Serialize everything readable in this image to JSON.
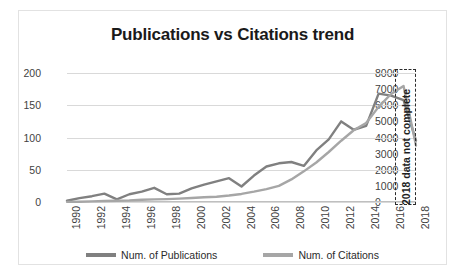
{
  "chart_data": {
    "type": "line",
    "title": "Publications vs Citations trend",
    "xlabel": "",
    "ylabel": "",
    "grid": true,
    "legend_position": "bottom",
    "x": [
      1990,
      1991,
      1992,
      1993,
      1994,
      1995,
      1996,
      1997,
      1998,
      1999,
      2000,
      2001,
      2002,
      2003,
      2004,
      2005,
      2006,
      2007,
      2008,
      2009,
      2010,
      2011,
      2012,
      2013,
      2014,
      2015,
      2016,
      2017,
      2018
    ],
    "xtick_labels": [
      "1990",
      "1992",
      "1994",
      "1996",
      "1998",
      "2000",
      "2002",
      "2004",
      "2006",
      "2008",
      "2010",
      "2012",
      "2014",
      "2016",
      "2018"
    ],
    "yticks_left": [
      0,
      50,
      100,
      150,
      200
    ],
    "ylim_left": [
      0,
      200
    ],
    "yticks_right": [
      0,
      1000,
      2000,
      3000,
      4000,
      5000,
      6000,
      7000,
      8000
    ],
    "ylim_right": [
      0,
      8000
    ],
    "series": [
      {
        "name": "Num. of Publications",
        "axis": "left",
        "color": "#808080",
        "values": [
          2,
          6,
          9,
          13,
          4,
          12,
          16,
          22,
          12,
          13,
          21,
          27,
          32,
          37,
          24,
          41,
          55,
          60,
          62,
          56,
          80,
          97,
          125,
          112,
          118,
          168,
          165,
          158,
          95
        ]
      },
      {
        "name": "Num. of Citations",
        "axis": "right",
        "color": "#a6a6a6",
        "values": [
          10,
          20,
          40,
          60,
          80,
          100,
          140,
          160,
          180,
          210,
          250,
          290,
          330,
          400,
          500,
          640,
          800,
          1000,
          1400,
          1900,
          2450,
          3100,
          3800,
          4450,
          4900,
          5900,
          6700,
          7200,
          3500
        ]
      }
    ],
    "annotation": {
      "text": "2018 data not complete",
      "orientation": "vertical",
      "style": "dashed-box"
    }
  },
  "legend": {
    "items": [
      {
        "label": "Num. of Publications",
        "color": "#808080"
      },
      {
        "label": "Num. of Citations",
        "color": "#a6a6a6"
      }
    ]
  }
}
